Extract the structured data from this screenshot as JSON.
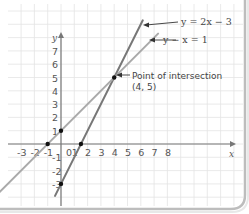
{
  "chart_data": {
    "type": "line",
    "title": "",
    "xlabel": "x",
    "ylabel": "y",
    "xlim": [
      -4.0,
      12.8
    ],
    "ylim": [
      -4.7,
      10.5
    ],
    "grid": true,
    "x_ticks": [
      -3,
      -2,
      -1,
      0,
      1,
      2,
      3,
      4,
      5,
      6,
      7,
      8
    ],
    "y_ticks": [
      -3,
      -2,
      -1,
      1,
      2,
      3,
      4,
      5,
      6,
      7
    ],
    "series": [
      {
        "name": "y = 2x − 3",
        "equation": "y = 2x - 3",
        "x": [
          -0.45,
          6.15
        ],
        "y": [
          -3.9,
          9.3
        ],
        "color": "#777777",
        "marked_points": [
          [
            0,
            -3
          ],
          [
            1.5,
            0
          ]
        ]
      },
      {
        "name": "y − x = 1",
        "equation": "y = x + 1",
        "x": [
          -4.6,
          7.3
        ],
        "y": [
          -3.6,
          8.3
        ],
        "color": "#a8a8a8",
        "marked_points": [
          [
            0,
            1
          ],
          [
            -1,
            0
          ]
        ]
      }
    ],
    "annotations": [
      {
        "text_lines": [
          "Point of intersection",
          "(4, 5)"
        ],
        "point": [
          4,
          5
        ]
      },
      {
        "text": "y = 2x − 3",
        "points_to_series": 0
      },
      {
        "text": "y − x = 1",
        "points_to_series": 1
      }
    ],
    "legend": null
  },
  "labels": {
    "x_axis": "x",
    "y_axis": "y",
    "intersection_line1": "Point of intersection",
    "intersection_line2": "(4, 5)",
    "eq1": "y = 2x − 3",
    "eq2": "y − x = 1"
  },
  "colors": {
    "grid": "#e4e4e4",
    "axis": "#777777",
    "line_steep": "#777777",
    "line_shallow": "#aaaaaa",
    "point": "#111111",
    "card_border": "#c8c8c8"
  }
}
